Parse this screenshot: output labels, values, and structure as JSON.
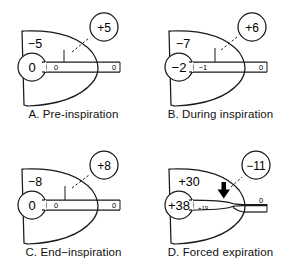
{
  "figure": {
    "pressure_units": "cm H2O",
    "line_color": "#1a1a1a",
    "background_color": "#ffffff"
  },
  "panels": [
    {
      "id": "A",
      "caption": "A. Pre-inspiration",
      "pleural_pressure": "−5",
      "alveolar_pressure": "0",
      "airway_mid_pressure": "0",
      "mouth_pressure": "0",
      "bubble_label": "+5",
      "bubble_sign": "positive",
      "airway_state": "open",
      "flow_marker": "no-flow-tick"
    },
    {
      "id": "B",
      "caption": "B. During inspiration",
      "pleural_pressure": "−7",
      "alveolar_pressure": "−2",
      "airway_mid_pressure": "−1",
      "mouth_pressure": "0",
      "bubble_label": "+6",
      "bubble_sign": "positive",
      "airway_state": "open",
      "flow_marker": "inward-flow-tick"
    },
    {
      "id": "C",
      "caption": "C. End−inspiration",
      "pleural_pressure": "−8",
      "alveolar_pressure": "0",
      "airway_mid_pressure": "0",
      "mouth_pressure": "0",
      "bubble_label": "+8",
      "bubble_sign": "positive",
      "airway_state": "open",
      "flow_marker": "no-flow-tick"
    },
    {
      "id": "D",
      "caption": "D. Forced expiration",
      "pleural_pressure": "+30",
      "alveolar_pressure": "+38",
      "airway_mid_pressure": "+19",
      "mouth_pressure": "0",
      "bubble_label": "−11",
      "bubble_sign": "negative",
      "airway_state": "compressed",
      "flow_marker": "compression-arrow"
    }
  ],
  "icons": {
    "bubble": "pressure-bubble",
    "leader": "dashed-leader-line",
    "compression_arrow": "down-arrow-icon",
    "flow_tick": "flow-tick-icon"
  }
}
